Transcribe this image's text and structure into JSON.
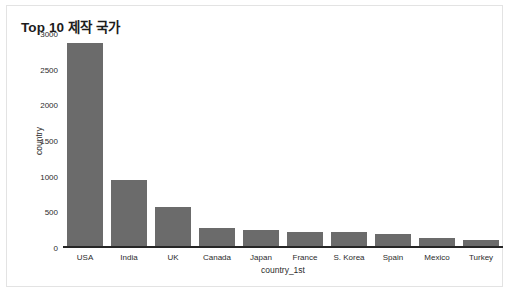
{
  "chart_data": {
    "type": "bar",
    "title": "Top 10 제작 국가",
    "xlabel": "country_1st",
    "ylabel": "country",
    "categories": [
      "USA",
      "India",
      "UK",
      "Canada",
      "Japan",
      "France",
      "S. Korea",
      "Spain",
      "Mexico",
      "Turkey"
    ],
    "values": [
      2870,
      960,
      575,
      280,
      250,
      230,
      225,
      190,
      135,
      110
    ],
    "ylim": [
      0,
      3000
    ],
    "yticks": [
      0,
      500,
      1000,
      1500,
      2000,
      2500,
      3000
    ],
    "ytick_labels": [
      "0",
      "500",
      "1000",
      "1500",
      "2000",
      "2500",
      "3000"
    ],
    "grid": false,
    "legend": "none",
    "bar_color": "#6b6b6b",
    "axis_color": "#262626",
    "background_color": "#ffffff"
  }
}
